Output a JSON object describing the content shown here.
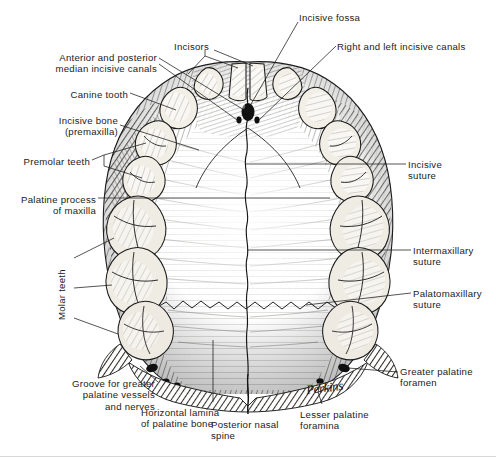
{
  "figure": {
    "signature": "Perkins",
    "ink_color": "#1b1b1b",
    "paper_color": "#ffffff",
    "bone_tone": "#6d6a63",
    "tooth_tone": "#f2efe8"
  },
  "labels": [
    {
      "id": "incisive-fossa",
      "text": "Incisive fossa",
      "x": 299,
      "y": 12,
      "align": "left",
      "rotated": false
    },
    {
      "id": "incisors",
      "text": "Incisors",
      "x": 174,
      "y": 41,
      "align": "left",
      "rotated": false
    },
    {
      "id": "right-left-incisive",
      "text": "Right and left incisive canals",
      "x": 337,
      "y": 41,
      "align": "left",
      "rotated": false
    },
    {
      "id": "median-incisive-canals",
      "text": "Anterior and posterior\nmedian incisive canals",
      "x": 157,
      "y": 52,
      "align": "right",
      "rotated": false
    },
    {
      "id": "canine-tooth",
      "text": "Canine tooth",
      "x": 128,
      "y": 89,
      "align": "right",
      "rotated": false
    },
    {
      "id": "incisive-bone",
      "text": "Incisive bone\n(premaxilla)",
      "x": 118,
      "y": 115,
      "align": "right",
      "rotated": false
    },
    {
      "id": "premolar-teeth",
      "text": "Premolar teeth",
      "x": 90,
      "y": 156,
      "align": "right",
      "rotated": false
    },
    {
      "id": "incisive-suture",
      "text": "Incisive\nsuture",
      "x": 408,
      "y": 159,
      "align": "left",
      "rotated": false
    },
    {
      "id": "palatine-process",
      "text": "Palatine process\nof maxilla",
      "x": 96,
      "y": 194,
      "align": "right",
      "rotated": false
    },
    {
      "id": "intermaxillary-suture",
      "text": "Intermaxillary\nsuture",
      "x": 413,
      "y": 245,
      "align": "left",
      "rotated": false
    },
    {
      "id": "molar-teeth",
      "text": "Molar teeth",
      "x": 56,
      "y": 320,
      "align": "left",
      "rotated": true
    },
    {
      "id": "palatomaxillary",
      "text": "Palatomaxillary\nsuture",
      "x": 413,
      "y": 288,
      "align": "left",
      "rotated": false
    },
    {
      "id": "greater-palatine-for",
      "text": "Greater palatine\nforamen",
      "x": 400,
      "y": 366,
      "align": "left",
      "rotated": false
    },
    {
      "id": "groove-greater-pal",
      "text": "Groove for greater\npalatine vessels\nand nerves",
      "x": 155,
      "y": 378,
      "align": "right",
      "rotated": false
    },
    {
      "id": "lesser-palatine-for",
      "text": "Lesser palatine\nforamina",
      "x": 300,
      "y": 409,
      "align": "left",
      "rotated": false
    },
    {
      "id": "horizontal-lamina",
      "text": "Horizontal lamina\nof palatine bone",
      "x": 141,
      "y": 407,
      "align": "left",
      "rotated": false
    },
    {
      "id": "posterior-nasal-spine",
      "text": "Posterior nasal\nspine",
      "x": 211,
      "y": 419,
      "align": "left",
      "rotated": false
    }
  ],
  "structures": {
    "teeth_right_side": [
      "central incisor",
      "lateral incisor",
      "canine",
      "first premolar",
      "second premolar",
      "first molar",
      "second molar",
      "third molar"
    ],
    "teeth_left_side": [
      "central incisor",
      "lateral incisor",
      "canine",
      "first premolar",
      "second premolar",
      "first molar",
      "second molar",
      "third molar"
    ],
    "sutures": [
      "median palatine suture",
      "incisive suture",
      "intermaxillary suture",
      "palatomaxillary suture",
      "transverse palatine suture"
    ],
    "foramina": [
      "incisive fossa",
      "right incisive canal",
      "left incisive canal",
      "greater palatine foramen",
      "lesser palatine foramina"
    ],
    "bones": [
      "maxilla (palatine process)",
      "palatine bone (horizontal lamina)",
      "incisive bone (premaxilla)"
    ]
  }
}
